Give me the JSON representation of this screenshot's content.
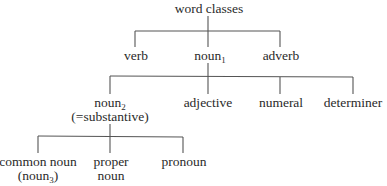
{
  "diagram": {
    "type": "tree",
    "title": "word classes",
    "nodes": {
      "root": {
        "text": "word classes"
      },
      "verb": {
        "text": "verb"
      },
      "noun1": {
        "text": "noun",
        "sub": "1"
      },
      "adverb": {
        "text": "adverb"
      },
      "noun2": {
        "text": "noun",
        "sub": "2",
        "line2": "(=substantive)"
      },
      "adjective": {
        "text": "adjective"
      },
      "numeral": {
        "text": "numeral"
      },
      "determiner": {
        "text": "determiner"
      },
      "common_noun": {
        "text": "common noun",
        "line2_pre": "(noun",
        "line2_sub": "3",
        "line2_post": ")"
      },
      "proper_noun": {
        "text": "proper",
        "line2": "noun"
      },
      "pronoun": {
        "text": "pronoun"
      }
    },
    "edges": [
      [
        "word classes",
        "verb"
      ],
      [
        "word classes",
        "noun1"
      ],
      [
        "word classes",
        "adverb"
      ],
      [
        "noun1",
        "noun2"
      ],
      [
        "noun1",
        "adjective"
      ],
      [
        "noun1",
        "numeral"
      ],
      [
        "noun1",
        "determiner"
      ],
      [
        "noun2",
        "common noun"
      ],
      [
        "noun2",
        "proper noun"
      ],
      [
        "noun2",
        "pronoun"
      ]
    ],
    "colors": {
      "text": "#2a2a2a",
      "lines": "#555555",
      "background": "#ffffff"
    }
  }
}
